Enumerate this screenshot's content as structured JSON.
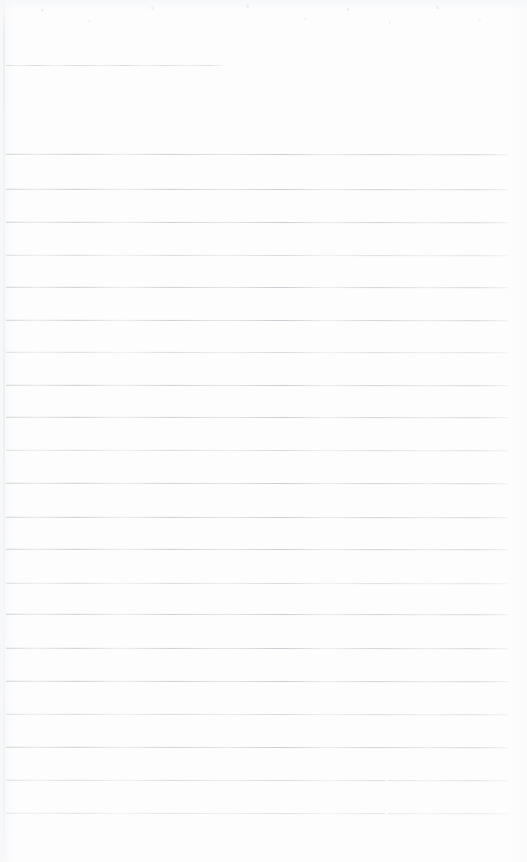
{
  "document": {
    "kind": "scanned-lined-paper",
    "title": "Blank ruled page",
    "page_width": 527,
    "page_height": 862,
    "background_color": "#fdfdfd",
    "rule_color": "#c9ccd1",
    "content_text": "",
    "notes": "No handwriting, no printed text, no figures — an empty ruled sheet."
  },
  "layout": {
    "left_margin_x": 6,
    "right_margin_x": 508,
    "top_margin_y": 8,
    "bottom_margin_y": 845,
    "rule_pitch": 32.6,
    "rule_count_total": 22,
    "rule_count_full_width": 21,
    "rule_count_short": 1
  },
  "rules": [
    {
      "name": "header-rule",
      "y": 65,
      "x1": 6,
      "x2": 223,
      "weight": "faint",
      "step_x": null
    },
    {
      "name": "body-rule-1",
      "y": 154,
      "x1": 6,
      "x2": 508,
      "weight": "normal",
      "step_x": null
    },
    {
      "name": "body-rule-2",
      "y": 189,
      "x1": 6,
      "x2": 508,
      "weight": "normal",
      "step_x": null
    },
    {
      "name": "body-rule-3",
      "y": 222,
      "x1": 6,
      "x2": 508,
      "weight": "normal",
      "step_x": null
    },
    {
      "name": "body-rule-4",
      "y": 255,
      "x1": 6,
      "x2": 508,
      "weight": "faint",
      "step_x": null
    },
    {
      "name": "body-rule-5",
      "y": 287,
      "x1": 6,
      "x2": 508,
      "weight": "normal",
      "step_x": null
    },
    {
      "name": "body-rule-6",
      "y": 320,
      "x1": 6,
      "x2": 508,
      "weight": "normal",
      "step_x": null
    },
    {
      "name": "body-rule-7",
      "y": 352,
      "x1": 6,
      "x2": 508,
      "weight": "faint",
      "step_x": null
    },
    {
      "name": "body-rule-8",
      "y": 385,
      "x1": 6,
      "x2": 508,
      "weight": "normal",
      "step_x": null
    },
    {
      "name": "body-rule-9",
      "y": 417,
      "x1": 6,
      "x2": 508,
      "weight": "normal",
      "step_x": null
    },
    {
      "name": "body-rule-10",
      "y": 450,
      "x1": 6,
      "x2": 508,
      "weight": "faint",
      "step_x": null
    },
    {
      "name": "body-rule-11",
      "y": 483,
      "x1": 6,
      "x2": 508,
      "weight": "normal",
      "step_x": null
    },
    {
      "name": "body-rule-12",
      "y": 517,
      "x1": 6,
      "x2": 508,
      "weight": "normal",
      "step_x": null
    },
    {
      "name": "body-rule-13",
      "y": 549,
      "x1": 6,
      "x2": 508,
      "weight": "normal",
      "step_x": null
    },
    {
      "name": "body-rule-14",
      "y": 583,
      "x1": 6,
      "x2": 508,
      "weight": "faint",
      "step_x": null
    },
    {
      "name": "body-rule-15",
      "y": 614,
      "x1": 6,
      "x2": 508,
      "weight": "normal",
      "step_x": null
    },
    {
      "name": "body-rule-16",
      "y": 648,
      "x1": 6,
      "x2": 508,
      "weight": "normal",
      "step_x": null
    },
    {
      "name": "body-rule-17",
      "y": 681,
      "x1": 6,
      "x2": 508,
      "weight": "normal",
      "step_x": null
    },
    {
      "name": "body-rule-18",
      "y": 714,
      "x1": 6,
      "x2": 508,
      "weight": "faint",
      "step_x": null
    },
    {
      "name": "body-rule-19",
      "y": 747,
      "x1": 6,
      "x2": 508,
      "weight": "normal",
      "step_x": null
    },
    {
      "name": "body-rule-20",
      "y": 780,
      "x1": 6,
      "x2": 508,
      "weight": "faint",
      "step_x": 385
    },
    {
      "name": "body-rule-21",
      "y": 813,
      "x1": 6,
      "x2": 508,
      "weight": "fainter",
      "step_x": 385
    }
  ]
}
